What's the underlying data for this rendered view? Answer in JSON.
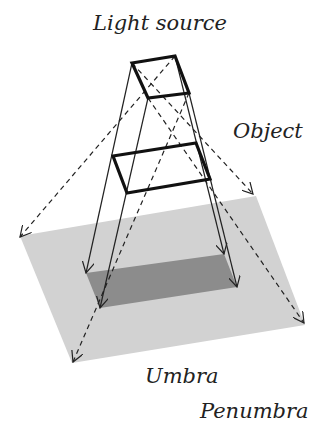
{
  "labels": {
    "light_source": "Light source",
    "object": "Object",
    "umbra": "Umbra",
    "penumbra": "Penumbra"
  },
  "colors": {
    "penumbra_fill": "#d2d2d2",
    "umbra_fill": "#8c8c8c",
    "line": "#222222",
    "background": "#ffffff"
  },
  "geometry": {
    "light_source": [
      [
        132,
        63
      ],
      [
        175,
        56
      ],
      [
        189,
        93
      ],
      [
        148,
        98
      ]
    ],
    "object": [
      [
        113,
        156
      ],
      [
        196,
        143
      ],
      [
        210,
        179
      ],
      [
        127,
        193
      ]
    ],
    "umbra": [
      [
        86,
        273
      ],
      [
        224,
        254
      ],
      [
        237,
        287
      ],
      [
        100,
        308
      ]
    ],
    "penumbra": [
      [
        20,
        236
      ],
      [
        256,
        196
      ],
      [
        305,
        325
      ],
      [
        72,
        363
      ]
    ]
  },
  "rays": {
    "solid": [
      {
        "from": [
          132,
          63
        ],
        "to": [
          86,
          273
        ]
      },
      {
        "from": [
          148,
          98
        ],
        "to": [
          100,
          308
        ]
      },
      {
        "from": [
          175,
          56
        ],
        "to": [
          224,
          254
        ]
      },
      {
        "from": [
          189,
          93
        ],
        "to": [
          237,
          287
        ]
      }
    ],
    "dashed": [
      {
        "from": [
          175,
          56
        ],
        "to": [
          20,
          237
        ]
      },
      {
        "from": [
          132,
          63
        ],
        "to": [
          253,
          194
        ]
      },
      {
        "from": [
          189,
          93
        ],
        "to": [
          73,
          362
        ]
      },
      {
        "from": [
          148,
          98
        ],
        "to": [
          304,
          323
        ]
      }
    ]
  }
}
